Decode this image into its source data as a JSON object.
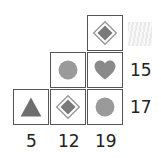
{
  "puzzle": {
    "type": "shape-sum-grid",
    "cells": [
      {
        "row": 0,
        "col": 2,
        "shape": "diamond-in-diamond"
      },
      {
        "row": 1,
        "col": 1,
        "shape": "circle"
      },
      {
        "row": 1,
        "col": 2,
        "shape": "heart"
      },
      {
        "row": 2,
        "col": 0,
        "shape": "triangle"
      },
      {
        "row": 2,
        "col": 1,
        "shape": "diamond-in-diamond"
      },
      {
        "row": 2,
        "col": 2,
        "shape": "circle"
      }
    ],
    "row_sums": {
      "row0": "",
      "row1": "15",
      "row2": "17"
    },
    "col_sums": {
      "col0": "5",
      "col1": "12",
      "col2": "19"
    },
    "hidden_answer_box": "hatched"
  },
  "colors": {
    "shape_dark": "#6e6e6e",
    "shape_light": "#9a9a9a",
    "border": "#555555"
  }
}
